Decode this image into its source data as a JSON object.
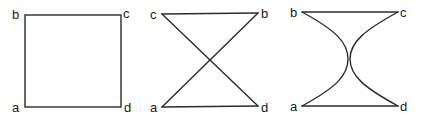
{
  "figures": [
    {
      "name": "square",
      "labels": {
        "a": "a",
        "b": "b",
        "c": "c",
        "d": "d"
      },
      "description": "Square with vertices b (top-left), c (top-right), a (bottom-left), d (bottom-right)"
    },
    {
      "name": "crossed-hourglass",
      "labels": {
        "a": "a",
        "b": "b",
        "c": "c",
        "d": "d"
      },
      "description": "Top edge c–b, bottom edge a–d, diagonals c–d and a–b crossing at center"
    },
    {
      "name": "curved-hourglass",
      "labels": {
        "a": "a",
        "b": "b",
        "c": "c",
        "d": "d"
      },
      "description": "Top edge b–c, bottom edge a–d, concave curves b–a and c–d touching at center"
    }
  ]
}
